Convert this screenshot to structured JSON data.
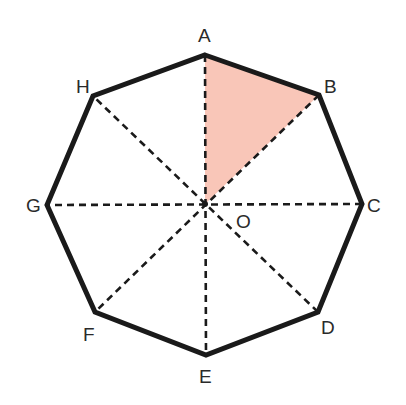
{
  "figure": {
    "type": "regular-octagon",
    "center": {
      "label": "O",
      "x": 205,
      "y": 204
    },
    "vertices": [
      {
        "label": "A",
        "x": 205,
        "y": 55
      },
      {
        "label": "B",
        "x": 319,
        "y": 95
      },
      {
        "label": "C",
        "x": 362,
        "y": 204
      },
      {
        "label": "D",
        "x": 318,
        "y": 312
      },
      {
        "label": "E",
        "x": 206,
        "y": 355
      },
      {
        "label": "F",
        "x": 95,
        "y": 312
      },
      {
        "label": "G",
        "x": 47,
        "y": 205
      },
      {
        "label": "H",
        "x": 93,
        "y": 96
      }
    ],
    "diagonals": [
      "AE",
      "BF",
      "CG",
      "DH"
    ],
    "shaded_region": {
      "triangle": "AOB",
      "color": "#f9c6b8"
    },
    "colors": {
      "outline": "#1a1a1a",
      "dashed": "#1a1a1a",
      "fill": "#f9c6b8"
    }
  },
  "labels": {
    "A": "A",
    "B": "B",
    "C": "C",
    "D": "D",
    "E": "E",
    "F": "F",
    "G": "G",
    "H": "H",
    "O": "O"
  }
}
